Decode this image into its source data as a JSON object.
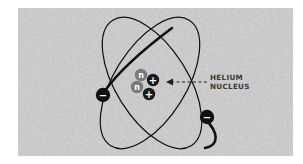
{
  "diagram": {
    "label": {
      "line1": "HELIUM",
      "line2": "NUCLEUS"
    },
    "nucleus": {
      "particles": [
        {
          "type": "neutron",
          "symbol": "n"
        },
        {
          "type": "proton",
          "symbol": "+"
        },
        {
          "type": "neutron",
          "symbol": "n"
        },
        {
          "type": "proton",
          "symbol": "+"
        }
      ]
    },
    "electrons": [
      {
        "symbol": "−",
        "charge": "negative"
      },
      {
        "symbol": "−",
        "charge": "negative"
      }
    ],
    "colors": {
      "background_texture": "#c8c8c8",
      "orbit": "#111111",
      "neutron": "#7a7a7a",
      "proton": "#1a1a1a",
      "label_text": "#3a3a3a"
    }
  }
}
